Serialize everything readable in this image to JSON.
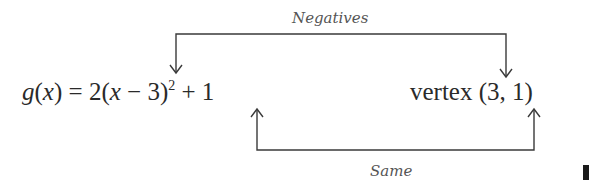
{
  "diagram": {
    "top_label": "Negatives",
    "bottom_label": "Same",
    "equation": {
      "func": "g",
      "arg": "x",
      "paren_open": "(",
      "paren_close": ")",
      "equals": "=",
      "coef": "2(",
      "var": "x",
      "minus": "−",
      "h": "3)",
      "exponent": "2",
      "plus": "+",
      "k": "1"
    },
    "vertex_word": "vertex",
    "vertex_coords": "(3, 1)",
    "colors": {
      "line": "#3a3a3a",
      "text": "#2a2a2a",
      "label": "#555555"
    }
  }
}
